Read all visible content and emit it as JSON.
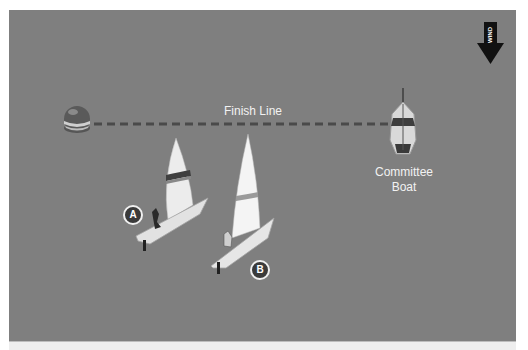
{
  "diagram": {
    "finish_line_label": "Finish Line",
    "committee_boat_label_line1": "Committee",
    "committee_boat_label_line2": "Boat",
    "boat_a_label": "A",
    "boat_b_label": "B",
    "wind_label": "WIND",
    "colors": {
      "water": "#7f7f7f",
      "finish_line": "#4a4a4a",
      "text": "#f2f2f2",
      "badge_fill": "#3a3a3a"
    }
  }
}
